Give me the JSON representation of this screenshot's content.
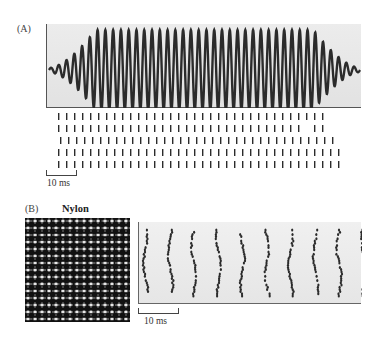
{
  "figure": {
    "panel_a": {
      "label": "(A)",
      "waveform": {
        "description": "sinusoidal vibration stimulus with ramped onset and offset",
        "cycles": 40,
        "ramp_up_cycles": 6,
        "ramp_down_cycles": 6
      },
      "raster": {
        "trials": 5,
        "spikes_per_trial": [
          34,
          34,
          35,
          36,
          36
        ],
        "description": "phase-locked spike trains, one spike per stimulus cycle"
      },
      "scale_bar": {
        "label": "10 ms"
      }
    },
    "panel_b": {
      "label": "(B)",
      "texture_title": "Nylon",
      "texture_image": "nylon fabric mesh (white grid on black)",
      "raster": {
        "columns": 10,
        "description": "spiking responses across trials organized in vertical bands"
      },
      "scale_bar": {
        "label": "10 ms"
      }
    }
  },
  "colors": {
    "panel_bg": "#e6e6e6",
    "trace": "#2b2b2b",
    "axis": "#555555",
    "nylon_bg": "#111111",
    "nylon_threads": "#e8e8e8"
  }
}
